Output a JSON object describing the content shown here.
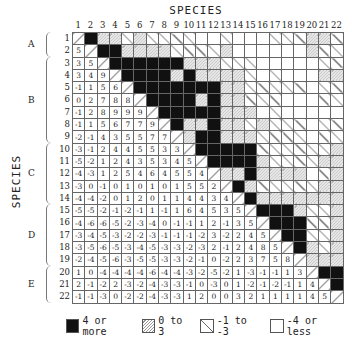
{
  "chart_data": {
    "type": "heatmap",
    "title": "SPECIES",
    "xlabel": "SPECIES",
    "ylabel": "SPECIES",
    "species": [
      1,
      2,
      3,
      4,
      5,
      6,
      7,
      8,
      9,
      10,
      11,
      12,
      13,
      14,
      15,
      16,
      17,
      18,
      19,
      20,
      21,
      22
    ],
    "groups": [
      {
        "label": "A",
        "rows": [
          1,
          2
        ]
      },
      {
        "label": "B",
        "rows": [
          3,
          4,
          5,
          6,
          7,
          8,
          9
        ]
      },
      {
        "label": "C",
        "rows": [
          10,
          11,
          12,
          13,
          14
        ]
      },
      {
        "label": "D",
        "rows": [
          15,
          16,
          17,
          18,
          19
        ]
      },
      {
        "label": "E",
        "rows": [
          20,
          21,
          22
        ]
      }
    ],
    "lower_triangle": [
      [],
      [
        5
      ],
      [
        3,
        5
      ],
      [
        3,
        4,
        9
      ],
      [
        -1,
        1,
        5,
        6
      ],
      [
        0,
        2,
        7,
        8,
        8
      ],
      [
        -1,
        2,
        8,
        9,
        9,
        9
      ],
      [
        -1,
        1,
        5,
        6,
        7,
        7,
        9
      ],
      [
        -2,
        -1,
        4,
        3,
        5,
        5,
        7,
        7
      ],
      [
        -3,
        -1,
        2,
        4,
        4,
        5,
        5,
        3,
        3
      ],
      [
        -5,
        -2,
        1,
        2,
        4,
        3,
        5,
        3,
        4,
        5
      ],
      [
        -4,
        -3,
        1,
        2,
        5,
        4,
        6,
        4,
        5,
        5,
        4
      ],
      [
        -3,
        0,
        -1,
        0,
        1,
        0,
        1,
        0,
        1,
        5,
        5,
        2
      ],
      [
        -4,
        -4,
        -2,
        0,
        1,
        2,
        0,
        1,
        1,
        4,
        4,
        3,
        4
      ],
      [
        -5,
        -5,
        -2,
        -1,
        -2,
        -1,
        1,
        -1,
        1,
        6,
        4,
        5,
        3,
        5
      ],
      [
        -4,
        -6,
        -6,
        -5,
        -2,
        -3,
        -4,
        0,
        -1,
        -1,
        1,
        2,
        -1,
        3,
        5
      ],
      [
        -3,
        -4,
        -5,
        -3,
        -2,
        -2,
        -3,
        -1,
        -1,
        -1,
        -2,
        3,
        -2,
        2,
        4,
        5
      ],
      [
        -3,
        -5,
        -6,
        -5,
        -3,
        -4,
        -5,
        -3,
        -3,
        -2,
        -3,
        2,
        -1,
        2,
        4,
        8,
        5
      ],
      [
        -2,
        -4,
        -5,
        -6,
        -3,
        -5,
        -5,
        -3,
        -3,
        -2,
        -1,
        0,
        -2,
        2,
        3,
        7,
        5,
        8
      ],
      [
        1,
        0,
        -4,
        -4,
        -4,
        -4,
        -6,
        -4,
        -4,
        -3,
        -2,
        -5,
        -2,
        1,
        -3,
        -1,
        -1,
        1,
        3
      ],
      [
        2,
        -1,
        -2,
        2,
        -3,
        -2,
        -4,
        -3,
        -3,
        -1,
        0,
        -3,
        0,
        1,
        -2,
        -1,
        -2,
        -1,
        1,
        4
      ],
      [
        -1,
        -1,
        -3,
        0,
        -2,
        -2,
        -4,
        -3,
        -3,
        1,
        2,
        0,
        0,
        3,
        2,
        1,
        1,
        1,
        1,
        4,
        5
      ]
    ],
    "legend": [
      {
        "label": "4 or more",
        "class": "black",
        "min": 4
      },
      {
        "label": "0 to 3",
        "class": "hatch",
        "min": 0,
        "max": 3
      },
      {
        "label": "-1 to -3",
        "class": "diag",
        "min": -3,
        "max": -1
      },
      {
        "label": "-4 or less",
        "class": "blank",
        "max": -4
      }
    ],
    "note": "Upper triangle shows the same pairwise values encoded by legend pattern; lower triangle shows numeric values; diagonal is self."
  },
  "labels": {
    "top_title": "SPECIES",
    "left_title": "SPECIES"
  }
}
